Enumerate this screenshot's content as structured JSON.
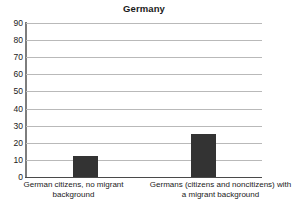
{
  "chart_data": {
    "type": "bar",
    "title": "Germany",
    "xlabel": "",
    "ylabel": "",
    "categories": [
      "German citizens, no migrant background",
      "Germans (citizens and noncitizens) with a migrant background"
    ],
    "values": [
      12,
      25
    ],
    "ylim": [
      0,
      90
    ],
    "yticks": [
      0,
      10,
      20,
      30,
      40,
      50,
      60,
      70,
      80,
      90
    ],
    "ytick_labels": [
      "0",
      "10",
      "20",
      "30",
      "40",
      "50",
      "60",
      "70",
      "80",
      "90"
    ],
    "grid": true,
    "legend": false,
    "bar_color": "#333333",
    "gridline_color": "#b9b9b9",
    "axis_color": "#4a4a4a",
    "background_color": "#ffffff"
  }
}
